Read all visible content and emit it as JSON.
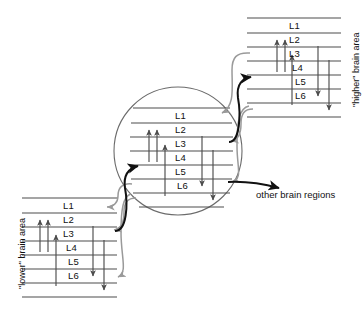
{
  "diagram": {
    "caption_other_regions": "other brain regions",
    "layer_names": [
      "L1",
      "L2",
      "L3",
      "L4",
      "L5",
      "L6"
    ],
    "colors": {
      "line": "#4d4d4d",
      "feedforward_arrow": "#111111",
      "feedback_arrow": "#9a9a9a",
      "circle": "#6b6b6b",
      "text": "#111111",
      "background": "#ffffff"
    },
    "blocks": [
      {
        "id": "higher",
        "label": "\"higher\" brain area",
        "position": "top-right",
        "layers": [
          "L1",
          "L2",
          "L3",
          "L4",
          "L5",
          "L6"
        ],
        "intrinsic_arrows": [
          {
            "direction": "up",
            "from": "L4",
            "to": "L3"
          },
          {
            "direction": "up",
            "from": "L4",
            "to": "L3"
          },
          {
            "direction": "up",
            "from": "L6",
            "to": "L4"
          },
          {
            "direction": "down",
            "from": "L2",
            "to": "L5"
          },
          {
            "direction": "down",
            "from": "L3",
            "to": "L6"
          }
        ]
      },
      {
        "id": "center",
        "label": "",
        "position": "center-in-circle",
        "layers": [
          "L1",
          "L2",
          "L3",
          "L4",
          "L5",
          "L6"
        ],
        "intrinsic_arrows": [
          {
            "direction": "up",
            "from": "L4",
            "to": "L3"
          },
          {
            "direction": "up",
            "from": "L4",
            "to": "L3"
          },
          {
            "direction": "up",
            "from": "L6",
            "to": "L4"
          },
          {
            "direction": "down",
            "from": "L2",
            "to": "L5"
          },
          {
            "direction": "down",
            "from": "L3",
            "to": "L6"
          }
        ]
      },
      {
        "id": "lower",
        "label": "\"lower\" brain area",
        "position": "bottom-left",
        "layers": [
          "L1",
          "L2",
          "L3",
          "L4",
          "L5",
          "L6"
        ],
        "intrinsic_arrows": [
          {
            "direction": "up",
            "from": "L4",
            "to": "L3"
          },
          {
            "direction": "up",
            "from": "L4",
            "to": "L3"
          },
          {
            "direction": "up",
            "from": "L6",
            "to": "L4"
          },
          {
            "direction": "down",
            "from": "L2",
            "to": "L5"
          },
          {
            "direction": "down",
            "from": "L3",
            "to": "L6"
          }
        ]
      }
    ],
    "connections": [
      {
        "type": "feedforward",
        "color": "black",
        "from": "lower L2/L3",
        "to": "center L4"
      },
      {
        "type": "feedforward",
        "color": "black",
        "from": "center L2/L3",
        "to": "higher L4"
      },
      {
        "type": "feedforward",
        "color": "black",
        "from": "center L5",
        "to": "other brain regions"
      },
      {
        "type": "feedback",
        "color": "gray",
        "from": "higher L6",
        "to": "center L1"
      },
      {
        "type": "feedback",
        "color": "gray",
        "from": "higher L6",
        "to": "center L5/L6"
      },
      {
        "type": "feedback",
        "color": "gray",
        "from": "center L6",
        "to": "lower L1"
      },
      {
        "type": "feedback",
        "color": "gray",
        "from": "center L6",
        "to": "lower L5/L6"
      }
    ]
  }
}
